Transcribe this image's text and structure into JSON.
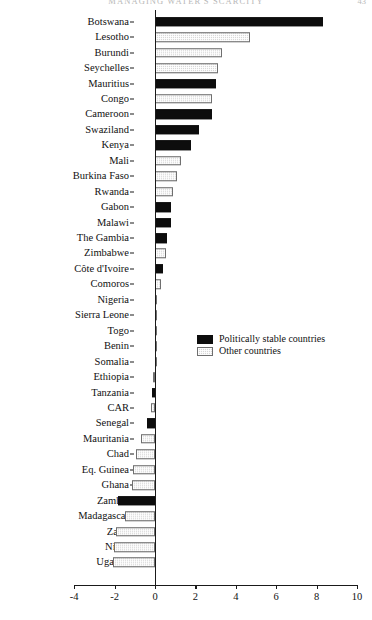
{
  "header": {
    "title": "MANAGING WATER'S SCARCITY",
    "page_number": "43"
  },
  "legend": {
    "position": "inside-right-middle",
    "entries": [
      {
        "label": "Politically stable countries",
        "swatch": "black-filled",
        "color": "#0d0d0d"
      },
      {
        "label": "Other countries",
        "swatch": "light-gray-hatched",
        "color": "#d8d8d8"
      }
    ]
  },
  "chart_data": {
    "type": "bar",
    "orientation": "horizontal",
    "title": "",
    "subtitle": "",
    "xlabel": "",
    "ylabel": "",
    "xlim": [
      -4,
      10
    ],
    "xticks": [
      -4,
      -2,
      0,
      2,
      4,
      6,
      8,
      10
    ],
    "xtick_labels": [
      "-4",
      "-2",
      "0",
      "2",
      "4",
      "6",
      "8",
      "10"
    ],
    "grid": false,
    "zero_line": 0,
    "legend_position": "center-right",
    "series": [
      {
        "name": "Politically stable countries",
        "color": "#0d0d0d"
      },
      {
        "name": "Other countries",
        "color": "#d8d8d8"
      }
    ],
    "categories": [
      "Botswana",
      "Lesotho",
      "Burundi",
      "Seychelles",
      "Mauritius",
      "Congo",
      "Cameroon",
      "Swaziland",
      "Kenya",
      "Mali",
      "Burkina Faso",
      "Rwanda",
      "Gabon",
      "Malawi",
      "The Gambia",
      "Zimbabwe",
      "Côte d'Ivoire",
      "Comoros",
      "Nigeria",
      "Sierra Leone",
      "Togo",
      "Benin",
      "Somalia",
      "Ethiopia",
      "Tanzania",
      "CAR",
      "Senegal",
      "Mauritania",
      "Chad",
      "Eq. Guinea",
      "Ghana",
      "Zambia",
      "Madagascar",
      "Zaire",
      "Niger",
      "Uganda"
    ],
    "values": [
      8.3,
      4.7,
      3.3,
      3.1,
      3.0,
      2.8,
      2.8,
      2.2,
      1.8,
      1.3,
      1.1,
      0.9,
      0.8,
      0.8,
      0.6,
      0.55,
      0.4,
      0.3,
      0.05,
      0.1,
      0.1,
      0.1,
      0.1,
      -0.1,
      -0.15,
      -0.2,
      -0.4,
      -0.7,
      -0.95,
      -1.1,
      -1.15,
      -1.85,
      -1.5,
      -1.95,
      -2.05,
      -2.1
    ],
    "groups": [
      "stable",
      "other",
      "other",
      "other",
      "stable",
      "other",
      "stable",
      "stable",
      "stable",
      "other",
      "other",
      "other",
      "stable",
      "stable",
      "stable",
      "other",
      "stable",
      "other",
      "other",
      "other",
      "other",
      "other",
      "other",
      "other",
      "stable",
      "other",
      "stable",
      "other",
      "other",
      "other",
      "other",
      "stable",
      "other",
      "other",
      "other",
      "other"
    ]
  }
}
